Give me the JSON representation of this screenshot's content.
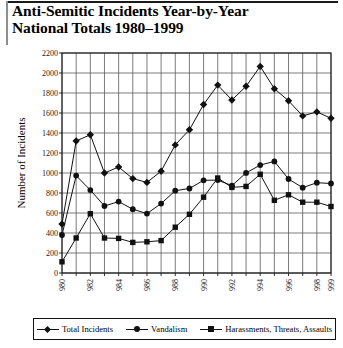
{
  "title": {
    "line1": "Anti-Semitic Incidents Year-by-Year",
    "line2": "National Totals 1980–1999"
  },
  "axes": {
    "ylabel": "Number of Incidents",
    "xlabel": "",
    "yticks": [
      "0",
      "200",
      "400",
      "600",
      "800",
      "1000",
      "1200",
      "1400",
      "1600",
      "1800",
      "2000",
      "2200"
    ],
    "xticks_labeled": [
      "1980",
      "1982",
      "1984",
      "1986",
      "1988",
      "1990",
      "1992",
      "1994",
      "1996",
      "1998",
      "1999"
    ]
  },
  "legend": {
    "items": [
      {
        "label": "Total Incidents",
        "marker": "diamond",
        "color": "#111111"
      },
      {
        "label": "Vandalism",
        "marker": "circle",
        "color": "#111111"
      },
      {
        "label": "Harassments, Threats, Assaults",
        "marker": "square",
        "color": "#111111"
      }
    ]
  },
  "chart_data": {
    "type": "line",
    "title": "Anti-Semitic Incidents Year-by-Year National Totals 1980–1999",
    "xlabel": "",
    "ylabel": "Number of Incidents",
    "ylim": [
      0,
      2200
    ],
    "ytick_step": 200,
    "grid": true,
    "legend_position": "bottom",
    "x": [
      1980,
      1981,
      1982,
      1983,
      1984,
      1985,
      1986,
      1987,
      1988,
      1989,
      1990,
      1991,
      1992,
      1993,
      1994,
      1995,
      1996,
      1997,
      1998,
      1999
    ],
    "series": [
      {
        "name": "Total Incidents",
        "marker": "diamond",
        "values": [
          490,
          1320,
          1382,
          1000,
          1060,
          944,
          906,
          1018,
          1281,
          1432,
          1685,
          1879,
          1730,
          1867,
          2066,
          1843,
          1722,
          1571,
          1611,
          1547
        ]
      },
      {
        "name": "Vandalism",
        "marker": "circle",
        "values": [
          380,
          974,
          829,
          670,
          714,
          638,
          594,
          694,
          823,
          845,
          927,
          929,
          874,
          1001,
          1079,
          1116,
          940,
          853,
          903,
          895
        ]
      },
      {
        "name": "Harassments, Threats, Assaults",
        "marker": "square",
        "values": [
          112,
          350,
          593,
          350,
          346,
          306,
          312,
          324,
          458,
          587,
          758,
          950,
          856,
          866,
          987,
          727,
          782,
          708,
          708,
          665
        ]
      }
    ]
  }
}
